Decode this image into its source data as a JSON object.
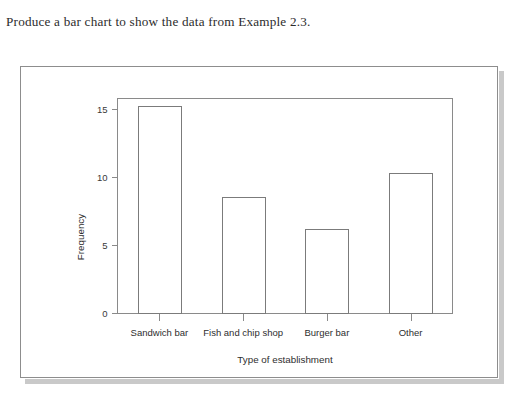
{
  "question": {
    "text": "Produce a bar chart to show the data from Example 2.3."
  },
  "figure": {
    "panel_border_color": "#8d8d8d",
    "shadow_color": "#c9c9c9",
    "background_color": "#ffffff"
  },
  "chart_data": {
    "type": "bar",
    "title": "",
    "categories": [
      "Sandwich bar",
      "Fish and chip shop",
      "Burger bar",
      "Other"
    ],
    "values": [
      15.2,
      8.5,
      6.2,
      10.3
    ],
    "xlabel": "Type of establishment",
    "ylabel": "Frequency",
    "ylim": [
      0,
      15.8
    ],
    "yticks": [
      0,
      5,
      10,
      15
    ],
    "ytick_labels": [
      "0",
      "5",
      "10",
      "15"
    ],
    "grid": false,
    "legend": false,
    "bar_fill": "#ffffff",
    "bar_stroke": "#7b7b7b",
    "axis_color": "#8a8a8a"
  }
}
